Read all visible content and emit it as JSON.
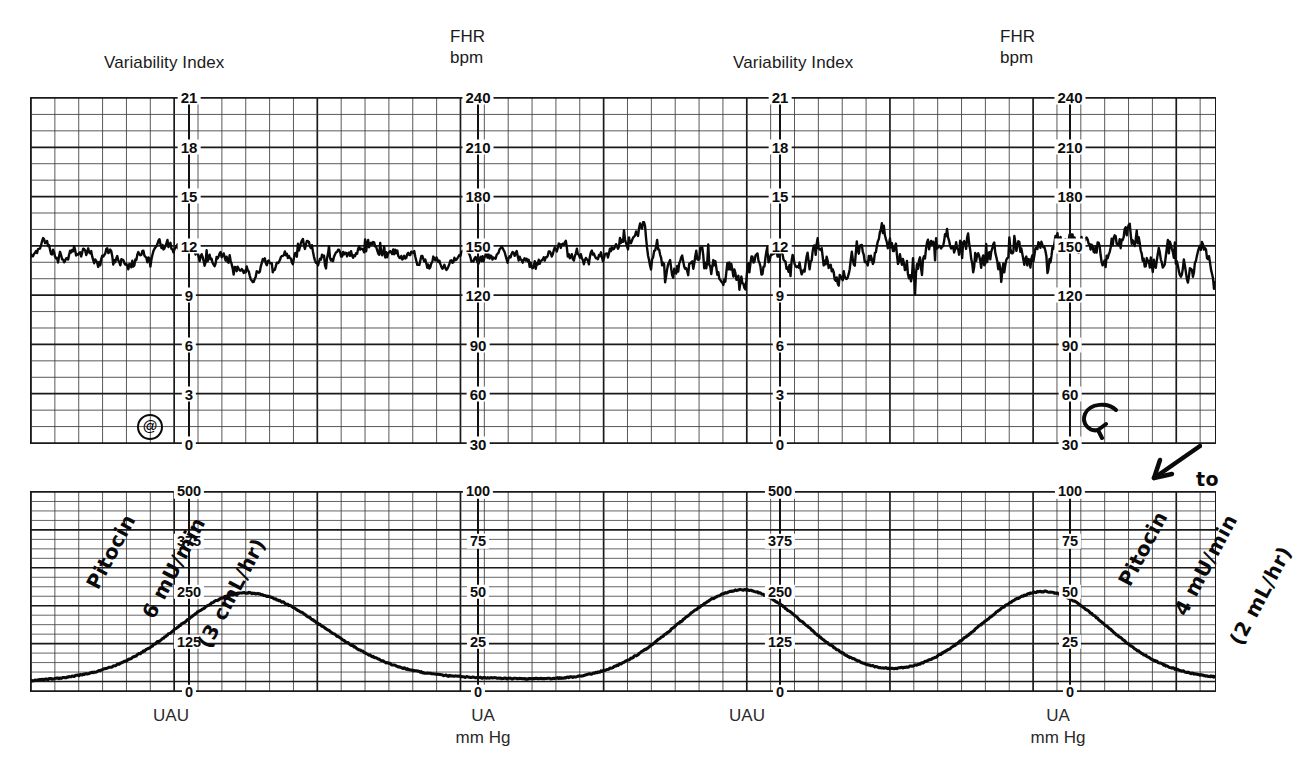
{
  "document": {
    "kind": "fetal-monitoring-strip",
    "paper_color": "#ffffff",
    "ink_color": "#1a1a1a"
  },
  "headers": {
    "variability_index": "Variability Index",
    "fhr": "FHR\nbpm"
  },
  "footers": {
    "uau": "UAU",
    "ua": "UA\nmm Hg"
  },
  "axes": {
    "variability_index": {
      "label": "Variability Index",
      "ticks": [
        "21",
        "18",
        "15",
        "12",
        "9",
        "6",
        "3",
        "0"
      ],
      "values": [
        21,
        18,
        15,
        12,
        9,
        6,
        3,
        0
      ],
      "min": 0,
      "max": 21
    },
    "fhr": {
      "label": "FHR bpm",
      "ticks": [
        "240",
        "210",
        "180",
        "150",
        "120",
        "90",
        "60",
        "30"
      ],
      "values": [
        240,
        210,
        180,
        150,
        120,
        90,
        60,
        30
      ],
      "min": 30,
      "max": 240
    },
    "uau": {
      "label": "UAU",
      "ticks": [
        "500",
        "375",
        "250",
        "125",
        "0"
      ],
      "values": [
        500,
        375,
        250,
        125,
        0
      ],
      "min": 0,
      "max": 500
    },
    "ua_mmhg": {
      "label": "UA mm Hg",
      "ticks": [
        "100",
        "75",
        "50",
        "25",
        "0"
      ],
      "values": [
        100,
        75,
        50,
        25,
        0
      ],
      "min": 0,
      "max": 100
    }
  },
  "annotations": {
    "left": {
      "line1": "Pitocin",
      "line2": "6 mU/min",
      "line3": "(3 cmL/hr)",
      "marker": "@",
      "full_text": "Pitocin 6 mU/min (3 cmL/hr) @"
    },
    "right": {
      "line1": "Pitocin",
      "line2": "4 mU/min",
      "line3": "(2 mL/hr)",
      "arrow_note": "to",
      "full_text": "Pitocin 4 mU/min (2 mL/hr) to"
    }
  },
  "chart_data": {
    "type": "line",
    "panels": [
      {
        "name": "fhr-panel-left",
        "ylabel_left": "Variability Index",
        "ylabel_right": "FHR bpm",
        "ylim_left": [
          0,
          21
        ],
        "ylim_right": [
          30,
          240
        ],
        "grid": true,
        "series": [
          {
            "name": "Fetal Heart Rate (left half)",
            "baseline_bpm": 143,
            "variability_bpm": 10,
            "units": "bpm"
          }
        ]
      },
      {
        "name": "fhr-panel-right",
        "ylabel_left": "Variability Index",
        "ylabel_right": "FHR bpm",
        "ylim_left": [
          0,
          21
        ],
        "ylim_right": [
          30,
          240
        ],
        "grid": true,
        "series": [
          {
            "name": "Fetal Heart Rate (right half)",
            "baseline_bpm": 144,
            "variability_bpm": 18,
            "units": "bpm"
          }
        ]
      },
      {
        "name": "ua-panel-left",
        "ylabel_left": "UAU",
        "ylabel_right": "UA mm Hg",
        "ylim_left": [
          0,
          500
        ],
        "ylim_right": [
          0,
          100
        ],
        "grid": true,
        "series": [
          {
            "name": "Uterine Activity (left half)",
            "units": "mm Hg",
            "baseline_mmhg": 5,
            "contractions": [
              {
                "onset_pct": 14,
                "peak_pct": 30,
                "end_pct": 48,
                "peak_mmhg": 50,
                "peak_uau": 250
              }
            ]
          }
        ]
      },
      {
        "name": "ua-panel-right",
        "ylabel_left": "UAU",
        "ylabel_right": "UA mm Hg",
        "ylim_left": [
          0,
          500
        ],
        "ylim_right": [
          0,
          100
        ],
        "grid": true,
        "series": [
          {
            "name": "Uterine Activity (right half)",
            "units": "mm Hg",
            "baseline_mmhg": 5,
            "contractions": [
              {
                "onset_pct": 55,
                "peak_pct": 71,
                "end_pct": 88,
                "peak_mmhg": 51,
                "peak_uau": 255
              },
              {
                "onset_pct": 5,
                "peak_pct": 22,
                "end_pct": 38,
                "peak_mmhg": 51,
                "peak_uau": 255
              }
            ]
          }
        ]
      }
    ]
  }
}
